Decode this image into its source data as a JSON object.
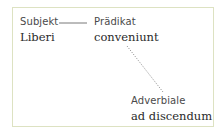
{
  "diagram": {
    "nodes": [
      {
        "id": "subjekt",
        "role": "Subjekt",
        "word": "Liberi"
      },
      {
        "id": "praedikat",
        "role": "Prädikat",
        "word": "conveniunt"
      },
      {
        "id": "adverbiale",
        "role": "Adverbiale",
        "word": "ad discendum"
      }
    ],
    "edges": [
      {
        "from": "subjekt",
        "to": "praedikat",
        "style": "solid"
      },
      {
        "from": "praedikat",
        "to": "adverbiale",
        "style": "dotted"
      }
    ],
    "colors": {
      "border": "#dde2c2",
      "text": "#2a2a2a",
      "label": "#4a4a4a"
    }
  }
}
